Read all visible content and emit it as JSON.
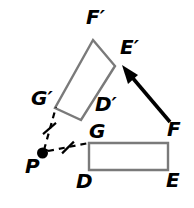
{
  "figure": {
    "background_color": "#ffffff",
    "width": 194,
    "height": 208,
    "stroke_color": "#000000",
    "shape_outline_color": "#808080"
  },
  "shapes": {
    "preimage": {
      "name": "rectangle-DEFG",
      "type": "rectangle",
      "outline_color": "#7a7a7a",
      "fill": "none",
      "stroke_width": 2.4,
      "points": "89,143 168,143 168,170 89,170",
      "vertices": [
        {
          "id": "G",
          "label": "G",
          "x": 89,
          "y": 143
        },
        {
          "id": "F",
          "label": "F",
          "x": 168,
          "y": 143
        },
        {
          "id": "E",
          "label": "E",
          "x": 168,
          "y": 170
        },
        {
          "id": "D",
          "label": "D",
          "x": 89,
          "y": 170
        }
      ]
    },
    "image": {
      "name": "rectangle-D-prime-E-prime-F-prime-G-prime",
      "type": "rectangle",
      "outline_color": "#7a7a7a",
      "fill": "none",
      "stroke_width": 2.4,
      "points": "93,40 115,66 81,120 55,108",
      "rotation_note": "rotated copy of DEFG about P",
      "vertices": [
        {
          "id": "Fp",
          "label": "F′",
          "x": 93,
          "y": 40
        },
        {
          "id": "Ep",
          "label": "E′",
          "x": 115,
          "y": 66
        },
        {
          "id": "Dp",
          "label": "D′",
          "x": 81,
          "y": 120
        },
        {
          "id": "Gp",
          "label": "G′",
          "x": 55,
          "y": 108
        }
      ]
    }
  },
  "center_of_rotation": {
    "name": "point-P",
    "label": "P",
    "x": 42.5,
    "y": 153,
    "dot_radius": 5.5,
    "dot_color": "#000000"
  },
  "dashed_segments": [
    {
      "name": "segment-P-to-G-prime",
      "from": "P",
      "to": "G′",
      "x1": 44,
      "y1": 150,
      "x2": 56,
      "y2": 107,
      "dash": "6,5",
      "stroke_width": 2.2,
      "tick_marks": 1
    },
    {
      "name": "segment-P-to-G",
      "from": "P",
      "to": "G",
      "x1": 48,
      "y1": 151,
      "x2": 89,
      "y2": 143,
      "dash": "6,5",
      "stroke_width": 2.2,
      "tick_marks": 1
    }
  ],
  "tick_marks": [
    {
      "name": "congruence-tick-left",
      "cx": 49.5,
      "cy": 128.5,
      "angle_deg": 60,
      "length": 13
    },
    {
      "name": "congruence-tick-right",
      "cx": 68,
      "cy": 147.5,
      "angle_deg": 115,
      "length": 13
    }
  ],
  "arrow": {
    "name": "rotation-direction-arrow",
    "label": "",
    "x1": 170,
    "y1": 122,
    "x2": 124,
    "y2": 68,
    "stroke_width": 3.6,
    "color": "#000000",
    "head_length": 17,
    "head_width": 13
  },
  "labels": [
    {
      "name": "label-F-prime",
      "text": "F′",
      "left": 86,
      "top": 7
    },
    {
      "name": "label-E-prime",
      "text": "E′",
      "left": 120,
      "top": 37
    },
    {
      "name": "label-G-prime",
      "text": "G′",
      "left": 31,
      "top": 88
    },
    {
      "name": "label-D-prime",
      "text": "D′",
      "left": 95,
      "top": 94
    },
    {
      "name": "label-G",
      "text": "G",
      "left": 89,
      "top": 121
    },
    {
      "name": "label-F",
      "text": "F",
      "left": 167,
      "top": 119
    },
    {
      "name": "label-P",
      "text": "P",
      "left": 25,
      "top": 156
    },
    {
      "name": "label-D",
      "text": "D",
      "left": 76,
      "top": 171
    },
    {
      "name": "label-E",
      "text": "E",
      "left": 166,
      "top": 170
    }
  ]
}
